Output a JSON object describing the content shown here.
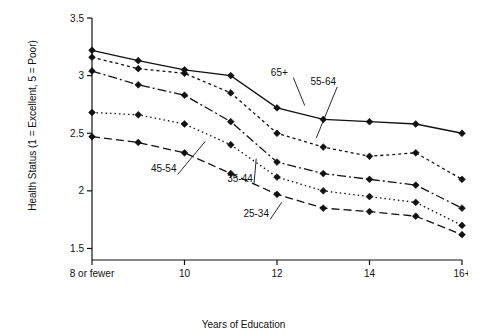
{
  "chart_data": {
    "type": "line",
    "title": "",
    "xlabel": "Years of Education",
    "ylabel": "Health Status (1 = Excellent, 5 = Poor)",
    "x": [
      8,
      9,
      10,
      11,
      12,
      13,
      14,
      15,
      16
    ],
    "xticklabels": [
      "8 or fewer",
      "10",
      "12",
      "14",
      "16+"
    ],
    "xtickvalues": [
      8,
      10,
      12,
      14,
      16
    ],
    "yticklabels": [
      "1.5",
      "2",
      "2.5",
      "3",
      "3.5"
    ],
    "ytickvalues": [
      1.5,
      2,
      2.5,
      3,
      3.5
    ],
    "ylim": [
      1.4,
      3.5
    ],
    "xlim": [
      8,
      16
    ],
    "grid": false,
    "legend_position": "inline-annotations",
    "series": [
      {
        "name": "65+",
        "style": "solid",
        "values": [
          3.22,
          3.13,
          3.05,
          3.0,
          2.72,
          2.62,
          2.6,
          2.58,
          2.5
        ]
      },
      {
        "name": "55-64",
        "style": "dotted",
        "values": [
          3.16,
          3.06,
          3.02,
          2.85,
          2.5,
          2.38,
          2.3,
          2.33,
          2.1
        ]
      },
      {
        "name": "45-54",
        "style": "dash-dot",
        "values": [
          3.04,
          2.92,
          2.83,
          2.6,
          2.25,
          2.15,
          2.1,
          2.05,
          1.85
        ]
      },
      {
        "name": "35-44",
        "style": "dotted-fine",
        "values": [
          2.68,
          2.66,
          2.58,
          2.4,
          2.12,
          2.0,
          1.95,
          1.9,
          1.7
        ]
      },
      {
        "name": "25-34",
        "style": "dashed",
        "values": [
          2.47,
          2.42,
          2.33,
          2.15,
          1.97,
          1.85,
          1.82,
          1.78,
          1.62
        ]
      }
    ],
    "annotations": [
      {
        "label": "65+",
        "x": 12.05,
        "y": 3.0,
        "anchor_x": 12.6,
        "anchor_y": 2.74
      },
      {
        "label": "55-64",
        "x": 13.0,
        "y": 2.92,
        "anchor_x": 12.85,
        "anchor_y": 2.46
      },
      {
        "label": "45-54",
        "x": 9.55,
        "y": 2.16,
        "anchor_x": 10.45,
        "anchor_y": 2.43
      },
      {
        "label": "35-44",
        "x": 11.2,
        "y": 2.08,
        "anchor_x": 11.55,
        "anchor_y": 2.28
      },
      {
        "label": "25-34",
        "x": 11.55,
        "y": 1.77,
        "anchor_x": 12.1,
        "anchor_y": 1.9
      }
    ]
  }
}
